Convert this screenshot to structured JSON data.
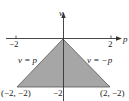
{
  "diagram": {
    "type": "region-plot",
    "axes": {
      "horizontal_label": "p",
      "vertical_label": "v",
      "h_ticks": [
        {
          "value": -2,
          "label": "−2"
        },
        {
          "value": 2,
          "label": "2"
        }
      ],
      "v_ticks": [
        {
          "value": -2,
          "label": "−2"
        }
      ]
    },
    "region": {
      "vertices": [
        [
          0,
          0
        ],
        [
          -2,
          -2
        ],
        [
          2,
          -2
        ]
      ],
      "fill": "#a6a6a6"
    },
    "boundary_labels": {
      "left": "v = p",
      "right": "v = −p"
    },
    "vertex_labels": {
      "bottom_left": "(−2, −2)",
      "bottom_right": "(2, −2)"
    }
  }
}
